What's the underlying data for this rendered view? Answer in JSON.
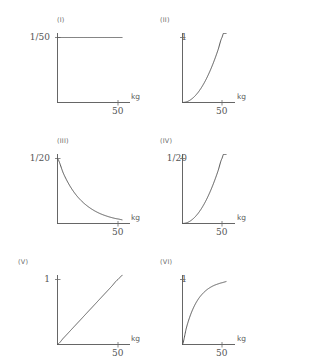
{
  "figure": {
    "layout": {
      "columns": 2,
      "rows": 3
    },
    "axis_unit_label": "kg",
    "x_tick_label": "50"
  },
  "chart_data": [
    {
      "type": "line",
      "title": "(I)",
      "xlabel": "kg",
      "ylabel": "1/50",
      "y_tick_labels": [
        "1/50"
      ],
      "x_tick_labels": [
        "50"
      ],
      "xlim": [
        0,
        50
      ],
      "ylim": [
        0,
        0.02
      ],
      "grid": false,
      "legend": "none",
      "description": "constant",
      "x": [
        0,
        5,
        10,
        15,
        20,
        25,
        30,
        35,
        40,
        45,
        50
      ],
      "values": [
        0.02,
        0.02,
        0.02,
        0.02,
        0.02,
        0.02,
        0.02,
        0.02,
        0.02,
        0.02,
        0.02
      ]
    },
    {
      "type": "line",
      "title": "(II)",
      "xlabel": "kg",
      "ylabel": "1",
      "y_tick_labels": [
        "1"
      ],
      "x_tick_labels": [
        "50"
      ],
      "xlim": [
        0,
        50
      ],
      "ylim": [
        0,
        1
      ],
      "grid": false,
      "legend": "none",
      "description": "convex increasing",
      "x": [
        0,
        5,
        10,
        15,
        20,
        25,
        30,
        35,
        40,
        45,
        50
      ],
      "values": [
        0.0,
        0.01,
        0.04,
        0.09,
        0.16,
        0.25,
        0.36,
        0.49,
        0.64,
        0.81,
        1.0
      ]
    },
    {
      "type": "line",
      "title": "(III)",
      "xlabel": "kg",
      "ylabel": "1/20",
      "y_tick_labels": [
        "1/20"
      ],
      "x_tick_labels": [
        "50"
      ],
      "xlim": [
        0,
        50
      ],
      "ylim": [
        0,
        0.05
      ],
      "grid": false,
      "legend": "none",
      "description": "exponential decay",
      "x": [
        0,
        5,
        10,
        15,
        20,
        25,
        30,
        35,
        40,
        45,
        50
      ],
      "values": [
        0.05,
        0.0383,
        0.0293,
        0.0224,
        0.0172,
        0.0132,
        0.0101,
        0.0077,
        0.0059,
        0.0045,
        0.0035
      ]
    },
    {
      "type": "line",
      "title": "(IV)",
      "xlabel": "kg",
      "ylabel": "1/20",
      "y_tick_labels": [
        "1/20"
      ],
      "x_tick_labels": [
        "50"
      ],
      "xlim": [
        0,
        50
      ],
      "ylim": [
        0,
        0.05
      ],
      "grid": false,
      "legend": "none",
      "description": "convex increasing",
      "x": [
        0,
        5,
        10,
        15,
        20,
        25,
        30,
        35,
        40,
        45,
        50
      ],
      "values": [
        0.0,
        0.0005,
        0.002,
        0.0045,
        0.008,
        0.0125,
        0.018,
        0.0245,
        0.032,
        0.0405,
        0.05
      ]
    },
    {
      "type": "line",
      "title": "(V)",
      "xlabel": "kg",
      "ylabel": "1",
      "y_tick_labels": [
        "1"
      ],
      "x_tick_labels": [
        "50"
      ],
      "xlim": [
        0,
        50
      ],
      "ylim": [
        0,
        1
      ],
      "grid": false,
      "legend": "none",
      "description": "linear increasing",
      "x": [
        0,
        5,
        10,
        15,
        20,
        25,
        30,
        35,
        40,
        45,
        50
      ],
      "values": [
        0.0,
        0.1,
        0.2,
        0.3,
        0.4,
        0.5,
        0.6,
        0.7,
        0.8,
        0.9,
        1.0
      ]
    },
    {
      "type": "line",
      "title": "(VI)",
      "xlabel": "kg",
      "ylabel": "1",
      "y_tick_labels": [
        "1"
      ],
      "x_tick_labels": [
        "50"
      ],
      "xlim": [
        0,
        50
      ],
      "ylim": [
        0,
        1
      ],
      "grid": false,
      "legend": "none",
      "description": "concave saturating increasing",
      "x": [
        0,
        5,
        10,
        15,
        20,
        25,
        30,
        35,
        40,
        45,
        50
      ],
      "values": [
        0.0,
        0.259,
        0.451,
        0.593,
        0.699,
        0.776,
        0.834,
        0.877,
        0.909,
        0.932,
        0.95
      ]
    }
  ]
}
